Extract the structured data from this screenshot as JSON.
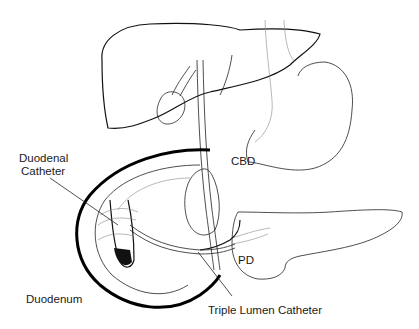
{
  "diagram": {
    "type": "anatomical-illustration",
    "labels": {
      "cbd": "CBD",
      "duodenal_catheter_line1": "Duodenal",
      "duodenal_catheter_line2": "Catheter",
      "pd": "PD",
      "duodenum": "Duodenum",
      "triple_lumen_catheter": "Triple Lumen Catheter"
    },
    "colors": {
      "background": "#ffffff",
      "line": "#111111"
    }
  }
}
